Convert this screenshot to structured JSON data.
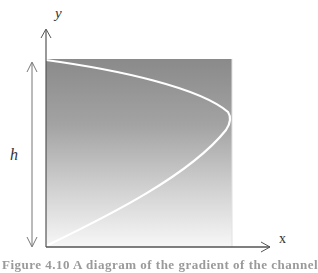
{
  "diagram": {
    "axes": {
      "x_label": "x",
      "y_label": "y"
    },
    "dimension": {
      "label": "h"
    },
    "region": {
      "gradient_top_color": "#8c8c8c",
      "gradient_bottom_color": "#f6f6f6",
      "curve_color": "#ffffff",
      "description": "Shaded region with parabolic velocity profile curve"
    },
    "caption": {
      "text": "Figure 4.10 A diagram of the gradient of the channel"
    }
  },
  "colors": {
    "axis": "#555555",
    "dimension_arrow": "#777777",
    "background": "#ffffff"
  }
}
